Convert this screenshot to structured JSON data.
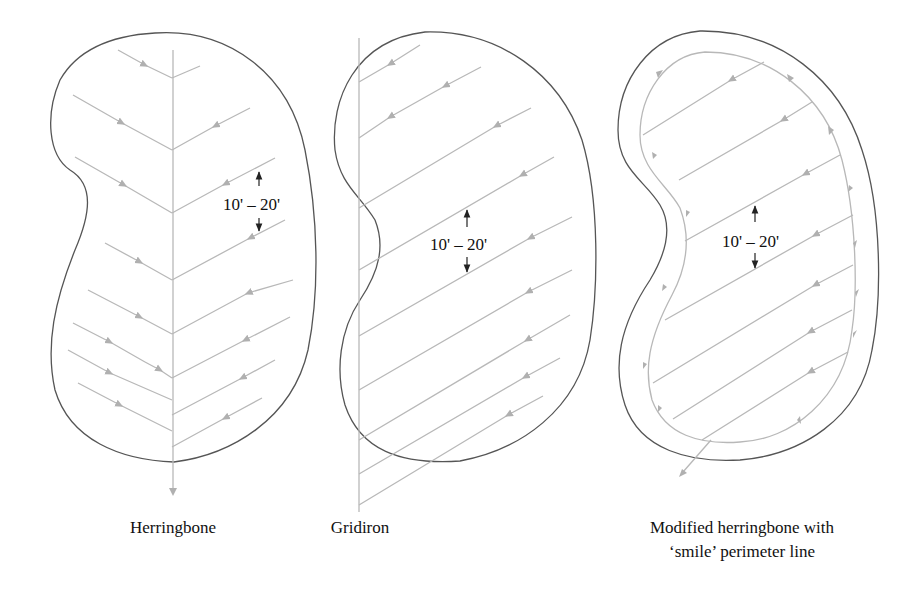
{
  "figure": {
    "panels": [
      {
        "id": "herringbone",
        "caption": "Herringbone",
        "spacing_label": "10' – 20'"
      },
      {
        "id": "gridiron",
        "caption": "Gridiron",
        "spacing_label": "10' – 20'"
      },
      {
        "id": "modified-herringbone",
        "caption_line1": "Modified herringbone with",
        "caption_line2": "‘smile’ perimeter line",
        "spacing_label": "10' – 20'"
      }
    ]
  },
  "colors": {
    "outline": "#555555",
    "drain_lines": "#b8b8b8",
    "dimension": "#222222",
    "text": "#111111"
  }
}
